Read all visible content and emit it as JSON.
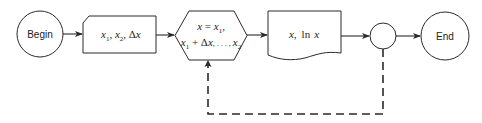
{
  "diagram": {
    "type": "flowchart",
    "nodes": [
      {
        "id": "begin",
        "shape": "terminal-circle",
        "label": "Begin"
      },
      {
        "id": "input",
        "shape": "card",
        "label": "x1, x2, Δx",
        "parts": {
          "x": "x",
          "sub1": "1",
          "sep1": ", ",
          "sub2": "2",
          "sep2": ", ",
          "delta": "Δ",
          "x3": "x"
        }
      },
      {
        "id": "loop",
        "shape": "hexagon",
        "line1": "x = x1,",
        "line2": "x1 + Δx, ..., x2",
        "parts": {
          "l1_x": "x",
          "l1_eq": " = ",
          "l1_x1": "x",
          "l1_sub": "1",
          "l1_comma": ",",
          "l2_x": "x",
          "l2_sub1": "1",
          "l2_plus": " + Δ",
          "l2_x2": "x",
          "l2_dots": ", . . . , ",
          "l2_x3": "x",
          "l2_sub2": "2"
        }
      },
      {
        "id": "output",
        "shape": "document",
        "label": "x, ln x",
        "parts": {
          "x": "x",
          "comma": ",",
          "ln": "ln",
          "x2": "x"
        }
      },
      {
        "id": "connector",
        "shape": "connector-circle",
        "label": ""
      },
      {
        "id": "end",
        "shape": "terminal-circle",
        "label": "End"
      }
    ],
    "edges": [
      {
        "from": "begin",
        "to": "input",
        "style": "solid"
      },
      {
        "from": "input",
        "to": "loop",
        "style": "solid"
      },
      {
        "from": "loop",
        "to": "output",
        "style": "solid"
      },
      {
        "from": "output",
        "to": "connector",
        "style": "solid"
      },
      {
        "from": "connector",
        "to": "end",
        "style": "solid"
      },
      {
        "from": "connector",
        "to": "loop",
        "style": "dashed",
        "note": "loop-back"
      }
    ]
  }
}
